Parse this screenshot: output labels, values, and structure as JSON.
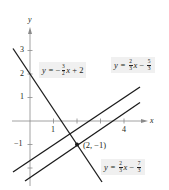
{
  "figure": {
    "axes": {
      "x_label": "x",
      "y_label": "y",
      "x_ticks": [
        {
          "value": 1,
          "label": "1"
        },
        {
          "value": 2,
          "label": ""
        },
        {
          "value": 3,
          "label": ""
        },
        {
          "value": 4,
          "label": "4"
        }
      ],
      "y_ticks": [
        {
          "value": 3,
          "label": "3"
        },
        {
          "value": 2,
          "label": "2"
        },
        {
          "value": 1,
          "label": "1"
        },
        {
          "value": -1,
          "label": "−1"
        },
        {
          "value": -2,
          "label": ""
        }
      ]
    },
    "lines": [
      {
        "name": "line-steep",
        "equation": {
          "lhs": "y =",
          "sign": "−",
          "num": "3",
          "den": "2",
          "var": "x",
          "rest": "+ 2"
        },
        "slope": -1.5,
        "intercept": 2
      },
      {
        "name": "line-upper-parallel",
        "equation": {
          "lhs": "y =",
          "sign": "",
          "num": "2",
          "den": "3",
          "var": "x",
          "rest_sign": "−",
          "rest_num": "5",
          "rest_den": "3"
        },
        "slope": 0.6667,
        "intercept": -1.6667
      },
      {
        "name": "line-lower-parallel",
        "equation": {
          "lhs": "y =",
          "sign": "",
          "num": "2",
          "den": "3",
          "var": "x",
          "rest_sign": "−",
          "rest_num": "7",
          "rest_den": "3"
        },
        "slope": 0.6667,
        "intercept": -2.3333
      }
    ],
    "point": {
      "x": 2,
      "y": -1,
      "label": "(2, −1)"
    }
  }
}
